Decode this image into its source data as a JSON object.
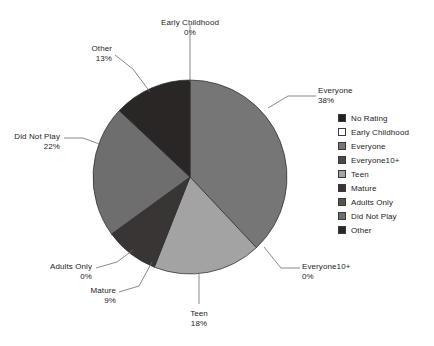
{
  "chart_data": {
    "type": "pie",
    "title": "",
    "subtitle": "",
    "categories": [
      "No Rating",
      "Early Childhood",
      "Everyone",
      "Everyone10+",
      "Teen",
      "Mature",
      "Adults Only",
      "Did Not Play",
      "Other"
    ],
    "values": [
      0,
      0,
      38,
      0,
      18,
      9,
      0,
      22,
      13
    ],
    "value_labels": [
      "0%",
      "0%",
      "38%",
      "0%",
      "18%",
      "9%",
      "0%",
      "22%",
      "13%"
    ],
    "unit": "%",
    "total": 100,
    "start_angle_deg": 0,
    "direction": "clockwise",
    "legend_position": "right",
    "grid": false,
    "colors": [
      "#231f1f",
      "#ffffff",
      "#767676",
      "#4d4747",
      "#a3a3a3",
      "#3a3535",
      "#585252",
      "#6e6e6e",
      "#2b2626"
    ],
    "slices": [
      {
        "label": "No Rating",
        "percent": 0,
        "percent_label": "0%",
        "color": "#231f1f",
        "visible_label": false
      },
      {
        "label": "Early Childhood",
        "percent": 0,
        "percent_label": "0%",
        "color": "#ffffff",
        "visible_label": true
      },
      {
        "label": "Everyone",
        "percent": 38,
        "percent_label": "38%",
        "color": "#767676",
        "visible_label": true
      },
      {
        "label": "Everyone10+",
        "percent": 0,
        "percent_label": "0%",
        "color": "#4d4747",
        "visible_label": true
      },
      {
        "label": "Teen",
        "percent": 18,
        "percent_label": "18%",
        "color": "#a3a3a3",
        "visible_label": true
      },
      {
        "label": "Mature",
        "percent": 9,
        "percent_label": "9%",
        "color": "#3a3535",
        "visible_label": true
      },
      {
        "label": "Adults Only",
        "percent": 0,
        "percent_label": "0%",
        "color": "#585252",
        "visible_label": true
      },
      {
        "label": "Did Not Play",
        "percent": 22,
        "percent_label": "22%",
        "color": "#6e6e6e",
        "visible_label": true
      },
      {
        "label": "Other",
        "percent": 13,
        "percent_label": "13%",
        "color": "#2b2626",
        "visible_label": true
      }
    ]
  },
  "callouts": [
    {
      "name": "Early Childhood",
      "percent_label": "0%"
    },
    {
      "name": "Everyone",
      "percent_label": "38%"
    },
    {
      "name": "Everyone10+",
      "percent_label": "0%"
    },
    {
      "name": "Teen",
      "percent_label": "18%"
    },
    {
      "name": "Mature",
      "percent_label": "9%"
    },
    {
      "name": "Adults Only",
      "percent_label": "0%"
    },
    {
      "name": "Did Not Play",
      "percent_label": "22%"
    },
    {
      "name": "Other",
      "percent_label": "13%"
    }
  ],
  "legend": {
    "items": [
      {
        "label": "No Rating",
        "color": "#231f1f"
      },
      {
        "label": "Early Childhood",
        "color": "#ffffff"
      },
      {
        "label": "Everyone",
        "color": "#767676"
      },
      {
        "label": "Everyone10+",
        "color": "#4d4747"
      },
      {
        "label": "Teen",
        "color": "#a3a3a3"
      },
      {
        "label": "Mature",
        "color": "#3a3535"
      },
      {
        "label": "Adults Only",
        "color": "#585252"
      },
      {
        "label": "Did Not Play",
        "color": "#6e6e6e"
      },
      {
        "label": "Other",
        "color": "#2b2626"
      }
    ]
  }
}
